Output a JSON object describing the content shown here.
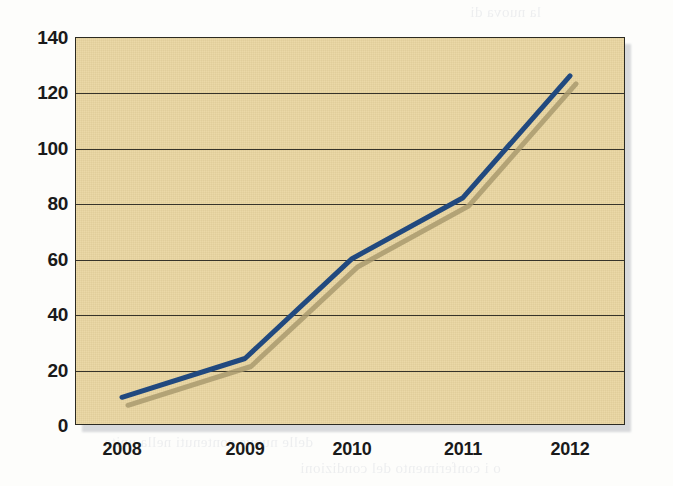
{
  "figure": {
    "kind": "scanned-line-chart",
    "plot_background_color": "#E9D5A0",
    "plot_border_color": "#2B2A21",
    "gridline_color": "#37342A",
    "page_background_color": "#FDFDFB"
  },
  "ghost_text": [
    {
      "text": "la nuova di",
      "x": 470,
      "y": 4
    },
    {
      "text": "li essere il concorso sulla circostanza, non che fatta",
      "x": 112,
      "y": 56
    },
    {
      "text": "un nonche sostenuta che sono adeguata concorrenza",
      "x": 118,
      "y": 82
    },
    {
      "text": "verso una condizione, come si sostenuto una cambiate che",
      "x": 104,
      "y": 108
    },
    {
      "text": "stati interessanti",
      "x": 118,
      "y": 134
    },
    {
      "text": "La parte che sono a i rapporti e nota espressa non importanza",
      "x": 104,
      "y": 180
    },
    {
      "text": "non e significativo giunto con una 3 di piu dei 126 euro",
      "x": 108,
      "y": 206
    },
    {
      "text": "che sono in genere sopra e di sul non interessanti",
      "x": 112,
      "y": 232
    },
    {
      "text": "questo numero del e anche riferisce a un conto la",
      "x": 110,
      "y": 258
    },
    {
      "text": "Sempre di attorno a sotto al movimento",
      "x": 106,
      "y": 284
    },
    {
      "text": "di stesso, e il degli. Come nuovo in concerto il rapporto",
      "x": 102,
      "y": 330
    },
    {
      "text": "quando i riferimento sostenere con 2010. Non rilevanza",
      "x": 100,
      "y": 356
    },
    {
      "text": "una proprio di una nuovo il anno e una anni approvato",
      "x": 100,
      "y": 382
    },
    {
      "text": "di che in i anni di una conferma e non e in il suo che",
      "x": 100,
      "y": 408
    },
    {
      "text": "delle nuove contenuti nella unita",
      "x": 104,
      "y": 434
    },
    {
      "text": "o i conferimento del condizioni",
      "x": 300,
      "y": 460
    }
  ],
  "chart_data": {
    "type": "line",
    "title": "",
    "subtitle": "",
    "xlabel": "",
    "ylabel": "",
    "categories": [
      "2008",
      "2009",
      "2010",
      "2011",
      "2012"
    ],
    "series": [
      {
        "name": "Series 1",
        "color": "#21497F",
        "shadow_color": "#A99A6E",
        "values": [
          10,
          24,
          60,
          82,
          126
        ]
      }
    ],
    "ylim": [
      0,
      140
    ],
    "y_ticks": [
      0,
      20,
      40,
      60,
      80,
      100,
      120,
      140
    ],
    "x_ticks": [
      "2008",
      "2009",
      "2010",
      "2011",
      "2012"
    ],
    "grid": "horizontal",
    "legend": "none",
    "line_width": 5,
    "markers": "none"
  }
}
